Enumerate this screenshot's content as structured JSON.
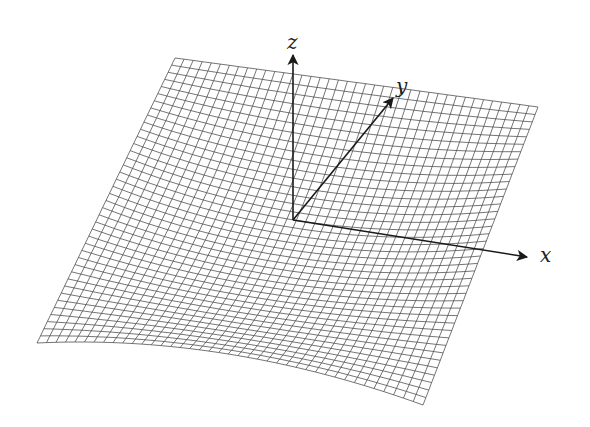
{
  "figure": {
    "type": "3d-surface-mesh",
    "background": "#ffffff",
    "mesh_color": "#3a3a3a",
    "axis_color": "#1a1a1a",
    "grid_u": 40,
    "grid_v": 40
  },
  "axes": {
    "origin": [
      293,
      220
    ],
    "x": {
      "label": "x",
      "tip": [
        527,
        257
      ],
      "label_pos": [
        540,
        243
      ]
    },
    "y": {
      "label": "y",
      "tip": [
        393,
        98
      ],
      "label_pos": [
        396,
        74
      ]
    },
    "z": {
      "label": "z",
      "tip": [
        293,
        55
      ],
      "label_pos": [
        287,
        30
      ]
    }
  },
  "surface": {
    "corners": {
      "back_left": [
        175,
        58
      ],
      "back_right": [
        538,
        107
      ],
      "front_left": [
        37,
        343
      ],
      "front_right": [
        423,
        405
      ]
    },
    "fold_point": [
      228,
      305
    ]
  }
}
